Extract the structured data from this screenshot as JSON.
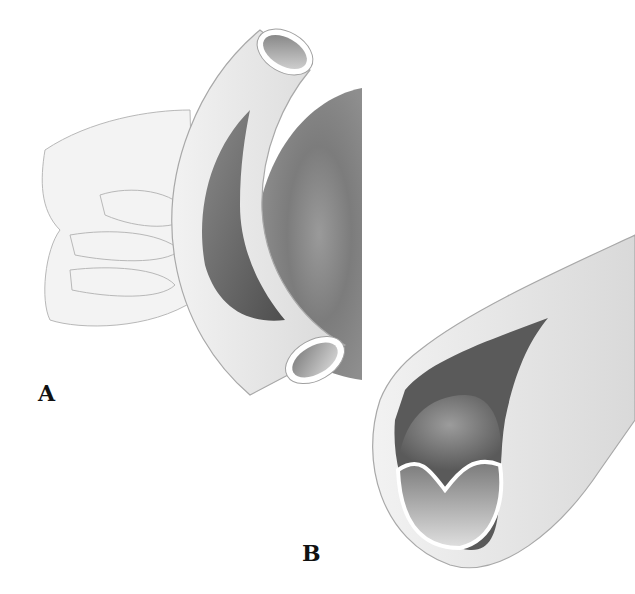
{
  "figure": {
    "panels": [
      {
        "id": "A",
        "label": "A",
        "description": "Hand holding curved vessel segment opened lengthwise beside organ"
      },
      {
        "id": "B",
        "label": "B",
        "description": "Cross-section of vessel with opened lumen showing folded inner lining"
      }
    ],
    "colors": {
      "background": "#ffffff",
      "vessel_wall": "#e6e6e6",
      "lumen_dark": "#6e6e6e",
      "organ": "#8a8a8a",
      "outline": "#9a9a9a",
      "label": "#111111"
    }
  }
}
